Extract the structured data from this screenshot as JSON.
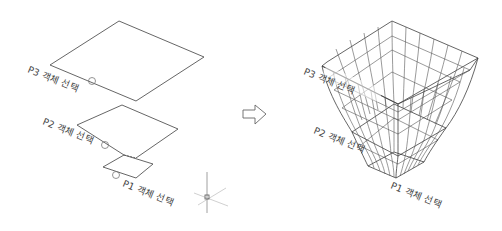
{
  "left_panel": {
    "labels": {
      "p3": "P3 객체 선택",
      "p2": "P2 객체 선택",
      "p1": "P1 객체 선택"
    },
    "profiles": [
      {
        "name": "P3",
        "points": [
          [
            119,
            21
          ],
          [
            204,
            57
          ],
          [
            136,
            101
          ],
          [
            50,
            65
          ]
        ],
        "pick_circle": [
          92,
          81
        ]
      },
      {
        "name": "P2",
        "points": [
          [
            122,
            105
          ],
          [
            178,
            129
          ],
          [
            136,
            158
          ],
          [
            77,
            125
          ]
        ],
        "pick_circle": [
          105,
          145
        ]
      },
      {
        "name": "P1",
        "points": [
          [
            124,
            155
          ],
          [
            153,
            164
          ],
          [
            136,
            178
          ],
          [
            103,
            167
          ]
        ],
        "pick_circle": [
          116,
          175
        ]
      }
    ],
    "ucs_icon": "ucs-crosshair-icon"
  },
  "arrow": {
    "icon": "right-arrow-icon"
  },
  "right_panel": {
    "labels": {
      "p3": "P3 객체 선택",
      "p2": "P2 객체 선택",
      "p1": "P1 객체 선택"
    },
    "result": "loft-wireframe-mesh"
  },
  "colors": {
    "background": "#ffffff",
    "line": "#555555",
    "text": "#444444"
  }
}
